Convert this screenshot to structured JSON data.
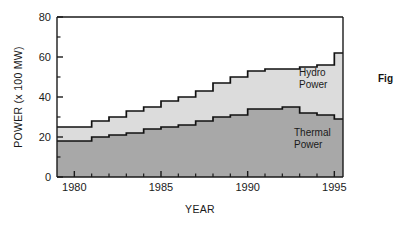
{
  "figure": {
    "caption_fragment": "Fig"
  },
  "chart_data": {
    "type": "area",
    "subtype": "stacked-step",
    "title": "",
    "xlabel": "YEAR",
    "ylabel": "POWER (x 100 MW)",
    "xlim": [
      1979,
      1995.5
    ],
    "ylim": [
      0,
      80
    ],
    "grid": false,
    "legend_position": "inside-plot-annotations",
    "x_major_ticks": [
      1980,
      1985,
      1990,
      1995
    ],
    "x_major_tick_labels": [
      "1980",
      "1985",
      "1990",
      "1995"
    ],
    "x_minor_ticks": [
      1981,
      1982,
      1983,
      1984,
      1986,
      1987,
      1988,
      1989,
      1991,
      1992,
      1993,
      1994
    ],
    "y_major_ticks": [
      0,
      20,
      40,
      60,
      80
    ],
    "y_major_tick_labels": [
      "0",
      "20",
      "40",
      "60",
      "80"
    ],
    "y_minor_ticks": [
      10,
      30,
      50,
      70
    ],
    "categories": [
      1979,
      1980,
      1981,
      1982,
      1983,
      1984,
      1985,
      1986,
      1987,
      1988,
      1989,
      1990,
      1991,
      1992,
      1993,
      1994,
      1995
    ],
    "series": [
      {
        "name": "Thermal Power",
        "color": "#a8a8a8",
        "values": [
          18,
          18,
          20,
          21,
          22,
          24,
          25,
          26,
          28,
          30,
          31,
          34,
          34,
          35,
          32,
          31,
          29
        ]
      },
      {
        "name": "Hydro Power",
        "color": "#dcdcdc",
        "values": [
          7,
          7,
          8,
          9,
          11,
          11,
          13,
          14,
          15,
          17,
          19,
          19,
          20,
          19,
          23,
          25,
          33
        ]
      }
    ],
    "totals": [
      25,
      25,
      28,
      30,
      33,
      35,
      38,
      40,
      43,
      47,
      50,
      53,
      54,
      54,
      55,
      56,
      62
    ],
    "annotations": [
      {
        "name": "hydro-power-label",
        "text_line1": "Hydro",
        "text_line2": "Power",
        "x": 1992.0,
        "y": 47
      },
      {
        "name": "thermal-power-label",
        "text_line1": "Thermal",
        "text_line2": "Power",
        "x": 1992.0,
        "y": 20
      }
    ]
  }
}
